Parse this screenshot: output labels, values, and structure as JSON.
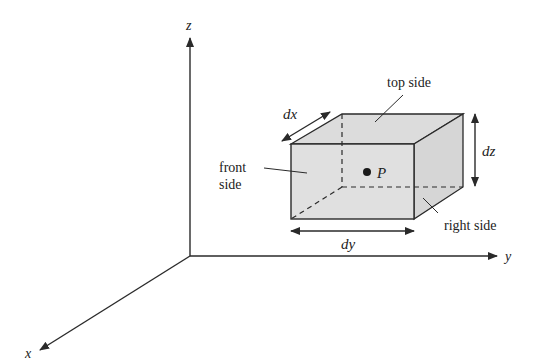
{
  "diagram": {
    "type": "3d-volume-element",
    "axes": {
      "x": {
        "label": "x"
      },
      "y": {
        "label": "y"
      },
      "z": {
        "label": "z"
      }
    },
    "box": {
      "point_label": "P",
      "dimensions": {
        "dx": "dx",
        "dy": "dy",
        "dz": "dz"
      },
      "face_labels": {
        "top": "top side",
        "front_line1": "front",
        "front_line2": "side",
        "right": "right side"
      }
    },
    "colors": {
      "face_fill": "#dcdcdc",
      "line": "#2a2a2a",
      "background": "#ffffff"
    }
  }
}
